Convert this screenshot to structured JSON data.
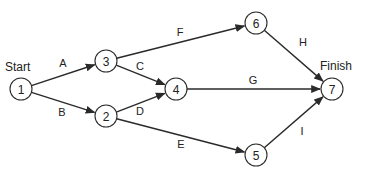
{
  "diagram": {
    "type": "activity-on-arrow network",
    "start_label": "Start",
    "finish_label": "Finish",
    "nodes": [
      {
        "id": "1",
        "label": "1",
        "x": 21,
        "y": 89
      },
      {
        "id": "2",
        "label": "2",
        "x": 106,
        "y": 116
      },
      {
        "id": "3",
        "label": "3",
        "x": 106,
        "y": 61
      },
      {
        "id": "4",
        "label": "4",
        "x": 176,
        "y": 89
      },
      {
        "id": "5",
        "label": "5",
        "x": 256,
        "y": 155
      },
      {
        "id": "6",
        "label": "6",
        "x": 256,
        "y": 23
      },
      {
        "id": "7",
        "label": "7",
        "x": 332,
        "y": 89
      }
    ],
    "edges": [
      {
        "label": "A",
        "from": "1",
        "to": "3",
        "lx": 63,
        "ly": 63
      },
      {
        "label": "B",
        "from": "1",
        "to": "2",
        "lx": 62,
        "ly": 112
      },
      {
        "label": "C",
        "from": "3",
        "to": "4",
        "lx": 140,
        "ly": 66
      },
      {
        "label": "D",
        "from": "2",
        "to": "4",
        "lx": 140,
        "ly": 111
      },
      {
        "label": "E",
        "from": "2",
        "to": "5",
        "lx": 181,
        "ly": 144
      },
      {
        "label": "F",
        "from": "3",
        "to": "6",
        "lx": 180,
        "ly": 32
      },
      {
        "label": "G",
        "from": "4",
        "to": "7",
        "lx": 253,
        "ly": 80
      },
      {
        "label": "H",
        "from": "6",
        "to": "7",
        "lx": 303,
        "ly": 42
      },
      {
        "label": "I",
        "from": "5",
        "to": "7",
        "lx": 302,
        "ly": 131
      }
    ],
    "node_radius": 11,
    "colors": {
      "stroke": "#2a2a2a",
      "text": "#222222",
      "background": "#ffffff"
    }
  }
}
